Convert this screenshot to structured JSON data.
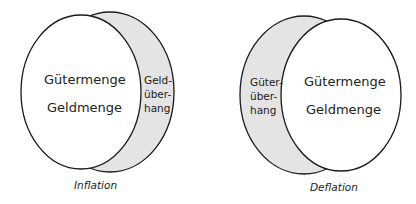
{
  "diagrams": [
    {
      "id": "inflation",
      "main_labels": [
        "Gütermenge",
        "Geldmenge"
      ],
      "crescent_label": [
        "Geld-",
        "über-",
        "hang"
      ],
      "caption": "Inflation",
      "crescent_side": "right"
    },
    {
      "id": "deflation",
      "main_labels": [
        "Gütermenge",
        "Geldmenge"
      ],
      "crescent_label": [
        "Güter-",
        "über-",
        "hang"
      ],
      "caption": "Deflation",
      "crescent_side": "left"
    }
  ],
  "colors": {
    "crescent_fill": "#e4e4e4",
    "circle_fill": "#ffffff",
    "stroke": "#1a1a1a"
  }
}
